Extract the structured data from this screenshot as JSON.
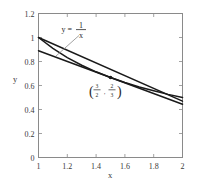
{
  "chart_data": {
    "type": "line",
    "title": "",
    "xlabel": "x",
    "ylabel": "y",
    "xlim": [
      1,
      2
    ],
    "ylim": [
      0,
      1.2
    ],
    "grid": false,
    "legend_position": "none",
    "xticks": [
      "1",
      "1.2",
      "1.4",
      "1.6",
      "1.8",
      "2"
    ],
    "xtick_values": [
      1,
      1.2,
      1.4,
      1.6,
      1.8,
      2
    ],
    "yticks": [
      "0",
      "0.2",
      "0.4",
      "0.6",
      "0.8",
      "1",
      "1.2"
    ],
    "ytick_values": [
      0,
      0.2,
      0.4,
      0.6,
      0.8,
      1,
      1.2
    ],
    "series": [
      {
        "name": "y = 1/x",
        "kind": "curve",
        "color": "#1a1a1a",
        "x": [
          1,
          1.1,
          1.2,
          1.3,
          1.4,
          1.5,
          1.6,
          1.7,
          1.8,
          1.9,
          2
        ],
        "values": [
          1,
          0.909,
          0.833,
          0.769,
          0.714,
          0.667,
          0.625,
          0.588,
          0.556,
          0.526,
          0.5
        ]
      },
      {
        "name": "tangent line at (3/2, 2/3)",
        "kind": "line",
        "color": "#1a1a1a",
        "x": [
          1,
          2
        ],
        "values": [
          0.889,
          0.444
        ]
      },
      {
        "name": "secant line",
        "kind": "line",
        "color": "#1a1a1a",
        "x": [
          1,
          2
        ],
        "values": [
          1.0,
          0.47
        ]
      }
    ],
    "points": [
      {
        "name": "marked-point",
        "x": 1.5,
        "y": 0.667,
        "label_numerator_x": "3",
        "label_denominator_x": "2",
        "label_numerator_y": "2",
        "label_denominator_y": "3"
      }
    ],
    "annotations": [
      {
        "name": "equation-annotation",
        "lhs": "y =",
        "numerator": "1",
        "denominator": "x",
        "leader_line": true
      }
    ]
  },
  "axis": {
    "x_label": "x",
    "y_label": "y"
  },
  "colors": {
    "curve": "#1a1a1a",
    "frame": "#8a8a8a",
    "text": "#3a3a3a"
  }
}
